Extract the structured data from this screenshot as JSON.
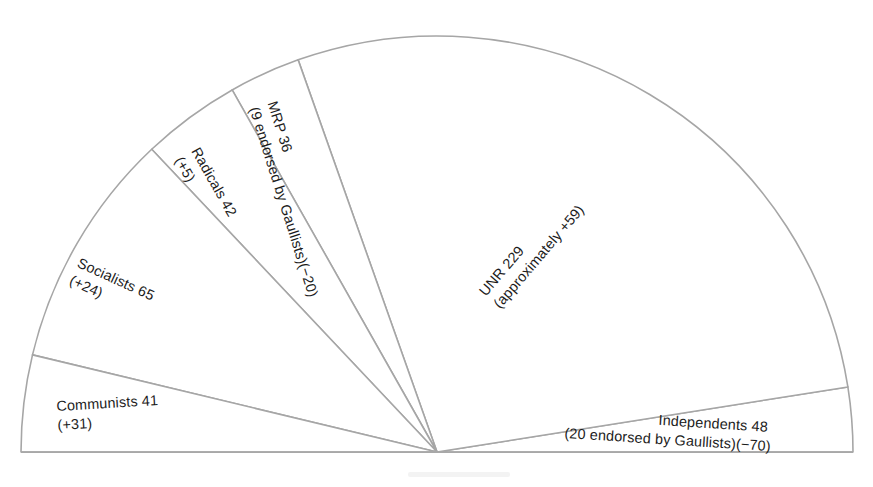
{
  "figure": {
    "kind": "semicircular-seat-diagram",
    "background_color": "#ffffff",
    "outline_color": "#a6a6a6",
    "text_color": "#1c1c1c"
  },
  "chart_data": {
    "type": "pie",
    "title": "",
    "subtitle": "",
    "xlabel": "",
    "ylabel": "",
    "layout": {
      "shape": "semicircle",
      "start_angle_deg": 0,
      "sweep_deg": 180,
      "direction": "counterclockwise",
      "center_x": 437,
      "center_y": 452,
      "radius": 428,
      "grid": false,
      "legend": "none",
      "labels_inside_slices": true
    },
    "total_seats": 461,
    "categories": [
      "Independents",
      "UNR",
      "MRP",
      "Radicals",
      "Socialists",
      "Communists"
    ],
    "values": [
      48,
      229,
      36,
      42,
      65,
      41
    ],
    "changes": [
      -70,
      59,
      -20,
      5,
      24,
      31
    ],
    "slices": [
      {
        "name": "Independents",
        "seats": 48,
        "change": -70,
        "angle_start_deg": 0,
        "angle_end_deg": 9,
        "label_line1": "Independents 48",
        "label_line2": "(20 endorsed by Gaullists)(−70)",
        "label_rotation_deg": 3.6
      },
      {
        "name": "UNR",
        "seats": 229,
        "change": 59,
        "approximate": true,
        "angle_start_deg": 9,
        "angle_end_deg": 109.5,
        "label_line1": "UNR 229",
        "label_line2": "(approximately +59)",
        "label_rotation_deg": -49.5
      },
      {
        "name": "MRP",
        "seats": 36,
        "change": -20,
        "angle_start_deg": 109.5,
        "angle_end_deg": 119.5,
        "label_line1": "MRP 36",
        "label_line2": "(9 endorsed by Gaullists)(−20)",
        "label_rotation_deg": 72.5
      },
      {
        "name": "Radicals",
        "seats": 42,
        "change": 5,
        "angle_start_deg": 119.5,
        "angle_end_deg": 133.3,
        "label_line1": "Radicals 42",
        "label_line2": "(+5)",
        "label_rotation_deg": 60.5
      },
      {
        "name": "Socialists",
        "seats": 65,
        "change": 24,
        "angle_start_deg": 133.3,
        "angle_end_deg": 166.5,
        "label_line1": "Socialists 65",
        "label_line2": "(+24)",
        "label_rotation_deg": 24.5
      },
      {
        "name": "Communists",
        "seats": 41,
        "change": 31,
        "angle_start_deg": 166.5,
        "angle_end_deg": 180,
        "label_line1": "Communists 41",
        "label_line2": "(+31)",
        "label_rotation_deg": -3.4
      }
    ]
  }
}
